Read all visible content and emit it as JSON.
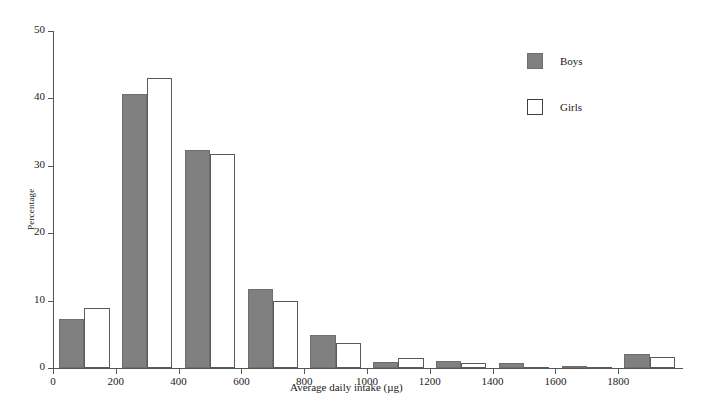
{
  "chart_data": {
    "type": "bar",
    "title": "",
    "xlabel": "Average daily intake (µg)",
    "ylabel": "Percentage",
    "categories": [
      "0-200",
      "200-400",
      "400-600",
      "600-800",
      "800-1000",
      "1000-1200",
      "1200-1400",
      "1400-1600",
      "1600-1800",
      "1800-2000"
    ],
    "series": [
      {
        "name": "Boys",
        "color": "#808080",
        "values": [
          7.3,
          40.7,
          32.4,
          11.7,
          4.9,
          0.9,
          1.0,
          0.8,
          0.25,
          2.1
        ]
      },
      {
        "name": "Girls",
        "color": "#ffffff",
        "values": [
          8.9,
          43.0,
          31.7,
          10.0,
          3.7,
          1.5,
          0.8,
          0.2,
          0.0,
          1.6
        ]
      }
    ],
    "xlim": [
      0,
      2000
    ],
    "ylim": [
      0,
      50
    ],
    "ytick_values": [
      0,
      10,
      20,
      30,
      40,
      50
    ],
    "ytick_labels": [
      "0",
      "10",
      "20",
      "30",
      "40",
      "50"
    ],
    "xtick_values": [
      0,
      200,
      400,
      600,
      800,
      1000,
      1200,
      1400,
      1600,
      1800
    ],
    "xtick_labels": [
      "0",
      "200",
      "400",
      "600",
      "800",
      "1000",
      "1200",
      "1400",
      "1600",
      "1800"
    ],
    "grid": false,
    "legend_position": "top-right",
    "bin_width": 200,
    "group_span": 160
  },
  "legend": {
    "items": [
      {
        "label": "Boys",
        "swatch": "filled-gray-square"
      },
      {
        "label": "Girls",
        "swatch": "open-white-square"
      }
    ]
  }
}
